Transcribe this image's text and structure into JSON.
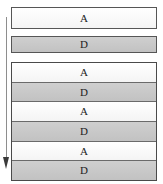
{
  "diagram": {
    "title": "",
    "arrow": {
      "name": "vertical-flow-arrow",
      "direction": "down",
      "color": "#3a3a3a"
    },
    "colors": {
      "light_fill": "#fafafa",
      "dark_fill": "#c9c9c9",
      "border": "#565656",
      "text": "#1d1d1d"
    },
    "standalone_nodes": [
      {
        "label": "A",
        "fill": "light"
      },
      {
        "label": "D",
        "fill": "dark"
      }
    ],
    "group": {
      "rows": [
        {
          "label": "A",
          "fill": "light"
        },
        {
          "label": "D",
          "fill": "dark"
        },
        {
          "label": "A",
          "fill": "light"
        },
        {
          "label": "D",
          "fill": "dark"
        },
        {
          "label": "A",
          "fill": "light"
        },
        {
          "label": "D",
          "fill": "dark"
        }
      ]
    }
  }
}
